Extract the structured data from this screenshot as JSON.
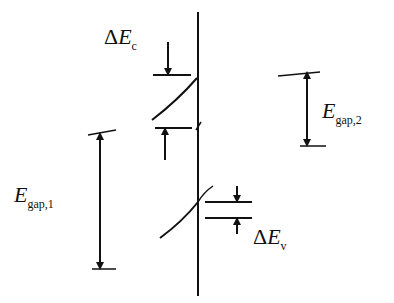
{
  "diagram": {
    "type": "band-diagram-heterojunction",
    "labels": {
      "delta_ec": {
        "prefix": "Δ",
        "symbol": "E",
        "sub": "c"
      },
      "delta_ev": {
        "prefix": "Δ",
        "symbol": "E",
        "sub": "v"
      },
      "egap1": {
        "symbol": "E",
        "sub": "gap,1"
      },
      "egap2": {
        "symbol": "E",
        "sub": "gap,2"
      }
    },
    "colors": {
      "ink": "#111111",
      "background": "#ffffff"
    }
  }
}
